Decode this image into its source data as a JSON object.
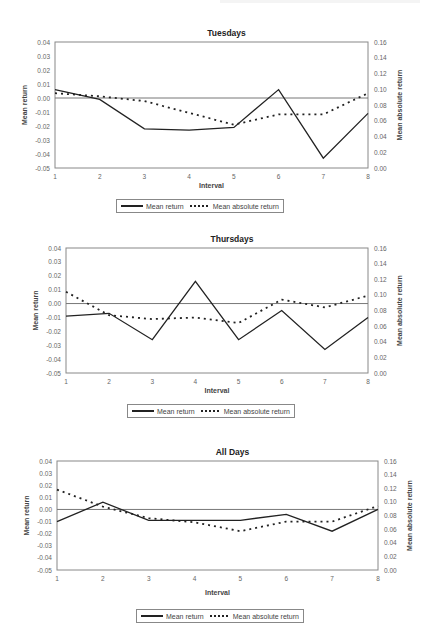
{
  "chart_data": [
    {
      "type": "line",
      "title": "Tuesdays",
      "xlabel": "Interval",
      "ylabel": "Mean return",
      "y2label": "Mean absolute return",
      "x": [
        1,
        2,
        3,
        4,
        5,
        6,
        7,
        8
      ],
      "ylim": [
        -0.05,
        0.04
      ],
      "y2lim": [
        0.0,
        0.16
      ],
      "yticks": [
        "0.04",
        "0.03",
        "0.02",
        "0.01",
        "0.00",
        "-0.01",
        "-0.02",
        "-0.03",
        "-0.04",
        "-0.05"
      ],
      "y2ticks": [
        "0.16",
        "0.14",
        "0.12",
        "0.10",
        "0.08",
        "0.06",
        "0.04",
        "0.02",
        "0.00"
      ],
      "xticks": [
        "1",
        "2",
        "3",
        "4",
        "5",
        "6",
        "7",
        "8"
      ],
      "reference_line_y": 0.0,
      "series": [
        {
          "name": "Mean return",
          "axis": "left",
          "style": "solid",
          "values": [
            0.006,
            -0.001,
            -0.022,
            -0.023,
            -0.021,
            0.006,
            -0.043,
            -0.011
          ]
        },
        {
          "name": "Mean absolute return",
          "axis": "right",
          "style": "dotted",
          "values": [
            0.095,
            0.091,
            0.085,
            0.07,
            0.055,
            0.068,
            0.068,
            0.095
          ]
        }
      ],
      "legend": {
        "position": "bottom",
        "items": [
          "Mean return",
          "Mean absolute return"
        ]
      }
    },
    {
      "type": "line",
      "title": "Thursdays",
      "xlabel": "Interval",
      "ylabel": "Mean return",
      "y2label": "Mean absolute return",
      "x": [
        1,
        2,
        3,
        4,
        5,
        6,
        7,
        8
      ],
      "ylim": [
        -0.05,
        0.04
      ],
      "y2lim": [
        0.0,
        0.16
      ],
      "yticks": [
        "0.04",
        "0.03",
        "0.02",
        "0.01",
        "0.00",
        "-0.01",
        "-0.02",
        "-0.03",
        "-0.04",
        "-0.05"
      ],
      "y2ticks": [
        "0.16",
        "0.14",
        "0.12",
        "0.10",
        "0.08",
        "0.06",
        "0.04",
        "0.02",
        "0.00"
      ],
      "xticks": [
        "1",
        "2",
        "3",
        "4",
        "5",
        "6",
        "7",
        "8"
      ],
      "reference_line_y": 0.0,
      "series": [
        {
          "name": "Mean return",
          "axis": "left",
          "style": "solid",
          "values": [
            -0.009,
            -0.007,
            -0.026,
            0.016,
            -0.026,
            -0.005,
            -0.033,
            -0.01
          ]
        },
        {
          "name": "Mean absolute return",
          "axis": "right",
          "style": "dotted",
          "values": [
            0.104,
            0.074,
            0.069,
            0.071,
            0.064,
            0.094,
            0.084,
            0.099
          ]
        }
      ],
      "legend": {
        "position": "bottom",
        "items": [
          "Mean return",
          "Mean absolute return"
        ]
      }
    },
    {
      "type": "line",
      "title": "All Days",
      "xlabel": "Interval",
      "ylabel": "Mean return",
      "y2label": "Mean absolute return",
      "x": [
        1,
        2,
        3,
        4,
        5,
        6,
        7,
        8
      ],
      "ylim": [
        -0.05,
        0.04
      ],
      "y2lim": [
        0.0,
        0.16
      ],
      "yticks": [
        "0.04",
        "0.03",
        "0.02",
        "0.01",
        "0.00",
        "-0.01",
        "-0.02",
        "-0.03",
        "-0.04",
        "-0.05"
      ],
      "y2ticks": [
        "0.16",
        "0.14",
        "0.12",
        "0.10",
        "0.08",
        "0.06",
        "0.04",
        "0.02",
        "0.00"
      ],
      "xticks": [
        "1",
        "2",
        "3",
        "4",
        "5",
        "6",
        "7",
        "8"
      ],
      "reference_line_y": 0.0,
      "series": [
        {
          "name": "Mean return",
          "axis": "left",
          "style": "solid",
          "values": [
            -0.01,
            0.006,
            -0.009,
            -0.009,
            -0.009,
            -0.004,
            -0.018,
            0.0
          ]
        },
        {
          "name": "Mean absolute return",
          "axis": "right",
          "style": "dotted",
          "values": [
            0.118,
            0.093,
            0.076,
            0.07,
            0.057,
            0.071,
            0.071,
            0.094
          ]
        }
      ],
      "legend": {
        "position": "bottom",
        "items": [
          "Mean return",
          "Mean absolute return"
        ]
      }
    }
  ]
}
